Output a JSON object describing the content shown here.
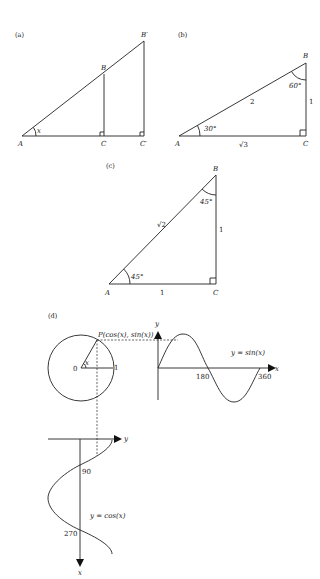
{
  "panels": {
    "a": {
      "label": "(a)",
      "vertices": {
        "A": "A",
        "B": "B",
        "B_prime": "B′",
        "C": "C",
        "C_prime": "C′"
      },
      "angle": "x"
    },
    "b": {
      "label": "(b)",
      "vertices": {
        "A": "A",
        "B": "B",
        "C": "C"
      },
      "hypotenuse": "2",
      "opposite": "1",
      "adjacent": "√3",
      "angle_A": "30°",
      "angle_B": "60°"
    },
    "c": {
      "label": "(c)",
      "vertices": {
        "A": "A",
        "B": "B",
        "C": "C"
      },
      "hypotenuse": "√2",
      "opposite": "1",
      "adjacent": "1",
      "angle_A": "45°",
      "angle_B": "45°"
    },
    "d": {
      "label": "(d)",
      "origin": "0",
      "radius_label": "1",
      "angle": "x",
      "point": "P(cos(x), sin(x))",
      "sine": {
        "y_axis": "y",
        "x_axis": "x",
        "ticks": [
          "180",
          "360"
        ],
        "curve_label": "y = sin(x)"
      },
      "cosine": {
        "y_axis": "y",
        "x_axis": "x",
        "ticks": [
          "90",
          "270"
        ],
        "curve_label": "y = cos(x)"
      }
    }
  }
}
